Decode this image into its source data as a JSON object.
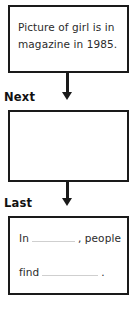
{
  "worksheet": {
    "steps": [
      {
        "id": "first",
        "step_label": "",
        "box_text_line1": "Picture of girl is in",
        "box_text_line2": "magazine in 1985."
      },
      {
        "id": "middle",
        "step_label": "Next",
        "box_text_line1": "",
        "box_text_line2": ""
      },
      {
        "id": "last",
        "step_label": "Last",
        "sentence_frame": {
          "part1": "In",
          "blank1": "",
          "part2": ", people",
          "part3": "find",
          "blank2": "",
          "part4": "."
        }
      }
    ],
    "connectors": [
      {
        "id": "first-to-middle",
        "icon": "down-arrow-icon"
      },
      {
        "id": "middle-to-last",
        "icon": "down-arrow-icon"
      }
    ],
    "colors": {
      "box_border": "#1a1a1a",
      "arrow": "#1a1a1a",
      "handwriting": "#2b2b2b",
      "label": "#111111",
      "blank_rule": "#cfcfcf",
      "background": "#ffffff"
    }
  }
}
